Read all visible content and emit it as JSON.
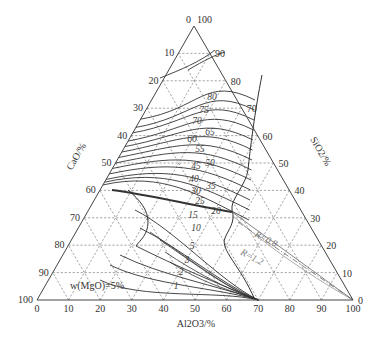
{
  "chart_data": {
    "type": "ternary",
    "title": "",
    "vertices": {
      "top": "SiO2 (100%)",
      "bottom_left": "CaO (100%)",
      "bottom_right": "Al2O3 (100%)"
    },
    "axes": {
      "left": {
        "title": "CaO/%",
        "ticks": [
          0,
          10,
          20,
          30,
          40,
          50,
          60,
          70,
          80,
          90,
          100
        ]
      },
      "right": {
        "title": "SiO2/%",
        "ticks": [
          100,
          90,
          80,
          70,
          60,
          50,
          40,
          30,
          20,
          10,
          0
        ]
      },
      "bottom": {
        "title": "Al2O3/%",
        "ticks": [
          0,
          10,
          20,
          30,
          40,
          50,
          60,
          70,
          80,
          90,
          100
        ]
      }
    },
    "grid": {
      "on": true,
      "style": "dashed",
      "step": 10
    },
    "annotation": "w(MgO)=5%",
    "contour_labels": [
      "80",
      "75",
      "70",
      "65",
      "60",
      "55",
      "50",
      "45",
      "40",
      "35",
      "30",
      "25",
      "20",
      "15",
      "10",
      "5",
      "3",
      "2",
      "1"
    ],
    "ratio_lines": [
      {
        "label": "R=0.8"
      },
      {
        "label": "R=1.2"
      }
    ]
  },
  "labels": {
    "top_left_tick": "0",
    "top_right_tick": "100",
    "left_axis_title": "CaO/%",
    "right_axis_title": "SiO2/%",
    "bottom_axis_title": "Al2O3/%",
    "note": "w(MgO)=5%",
    "r08": "R=0.8",
    "r12": "R=1.2"
  }
}
